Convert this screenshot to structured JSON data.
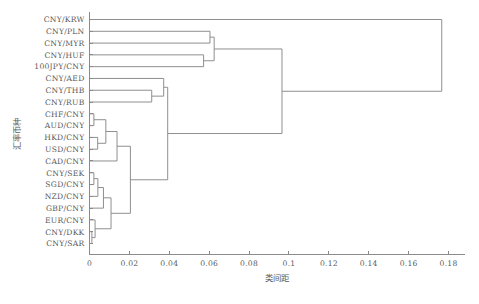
{
  "chart_data": {
    "type": "dendrogram",
    "title": "",
    "xlabel": "类间距",
    "ylabel": "汇率币种",
    "xlim": [
      0,
      0.188
    ],
    "xticks": [
      0,
      0.02,
      0.04,
      0.06,
      0.08,
      0.1,
      0.12,
      0.14,
      0.16,
      0.18
    ],
    "xticklabels": [
      "0",
      "0.02",
      "0.04",
      "0.06",
      "0.08",
      "0.1",
      "0.12",
      "0.14",
      "0.16",
      "0.18"
    ],
    "grid": false,
    "legend": null,
    "orientation": "left",
    "line_color": "#8f8f8f",
    "axis_color": "#8a8a8a",
    "leaves": [
      "CNY/KRW",
      "CNY/PLN",
      "CNY/MYR",
      "CNY/HUF",
      "100JPY/CNY",
      "CNY/AED",
      "CNY/THB",
      "CNY/RUB",
      "CHF/CNY",
      "AUD/CNY",
      "HKD/CNY",
      "USD/CNY",
      "CAD/CNY",
      "CNY/SEK",
      "SGD/CNY",
      "NZD/CNY",
      "GBP/CNY",
      "EUR/CNY",
      "CNY/DKK",
      "CNY/SAR"
    ],
    "merges": [
      {
        "id": "m1",
        "a": "CNY/DKK",
        "b": "CNY/SAR",
        "height": 0.0012
      },
      {
        "id": "m2",
        "a": "EUR/CNY",
        "b": "m1",
        "height": 0.0028
      },
      {
        "id": "m3",
        "a": "CNY/SEK",
        "b": "SGD/CNY",
        "height": 0.0022
      },
      {
        "id": "m4",
        "a": "m3",
        "b": "NZD/CNY",
        "height": 0.0042
      },
      {
        "id": "m5",
        "a": "m4",
        "b": "GBP/CNY",
        "height": 0.007
      },
      {
        "id": "m6",
        "a": "m5",
        "b": "m2",
        "height": 0.0108
      },
      {
        "id": "m7",
        "a": "CHF/CNY",
        "b": "AUD/CNY",
        "height": 0.0022
      },
      {
        "id": "m8",
        "a": "HKD/CNY",
        "b": "USD/CNY",
        "height": 0.0041
      },
      {
        "id": "m9",
        "a": "m7",
        "b": "m8",
        "height": 0.0082
      },
      {
        "id": "m10",
        "a": "m9",
        "b": "CAD/CNY",
        "height": 0.0138
      },
      {
        "id": "m11",
        "a": "m10",
        "b": "m6",
        "height": 0.0205
      },
      {
        "id": "m12",
        "a": "CNY/THB",
        "b": "CNY/RUB",
        "height": 0.0312
      },
      {
        "id": "m13",
        "a": "m12",
        "b": "CNY/AED",
        "height": 0.0372
      },
      {
        "id": "m14",
        "a": "m13",
        "b": "m11",
        "height": 0.0392
      },
      {
        "id": "m15",
        "a": "CNY/PLN",
        "b": "CNY/MYR",
        "height": 0.0604
      },
      {
        "id": "m16",
        "a": "CNY/HUF",
        "b": "100JPY/CNY",
        "height": 0.0572
      },
      {
        "id": "m17",
        "a": "m15",
        "b": "m16",
        "height": 0.0625
      },
      {
        "id": "m18",
        "a": "m17",
        "b": "m14",
        "height": 0.0965
      },
      {
        "id": "m19",
        "a": "CNY/KRW",
        "b": "m18",
        "height": 0.1766
      }
    ]
  },
  "axes": {
    "x_title": "类间距",
    "y_title": "汇率币种"
  }
}
